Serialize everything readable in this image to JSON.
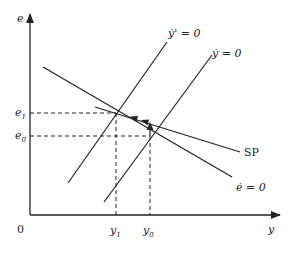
{
  "diagram": {
    "axes": {
      "y_axis_label": "e",
      "x_axis_label": "y",
      "origin_label": "0"
    },
    "levels": {
      "e1": {
        "base": "e",
        "sub": "1"
      },
      "e0": {
        "base": "e",
        "sub": "0"
      },
      "y1": {
        "base": "y",
        "sub": "1"
      },
      "y0": {
        "base": "y",
        "sub": "0"
      }
    },
    "curves": [
      {
        "id": "ydot-prime",
        "label": "ẏ' = 0",
        "from": [
          68,
          183
        ],
        "to": [
          167,
          42
        ]
      },
      {
        "id": "ydot",
        "label": "ẏ = 0",
        "from": [
          104,
          202
        ],
        "to": [
          212,
          55
        ]
      },
      {
        "id": "edot",
        "label": "ė = 0",
        "from": [
          43,
          67
        ],
        "to": [
          232,
          177
        ]
      },
      {
        "id": "sp",
        "label": "SP",
        "from": [
          95,
          107
        ],
        "to": [
          240,
          152
        ]
      }
    ],
    "colors": {
      "line": "#222222",
      "background": "#ffffff"
    }
  }
}
